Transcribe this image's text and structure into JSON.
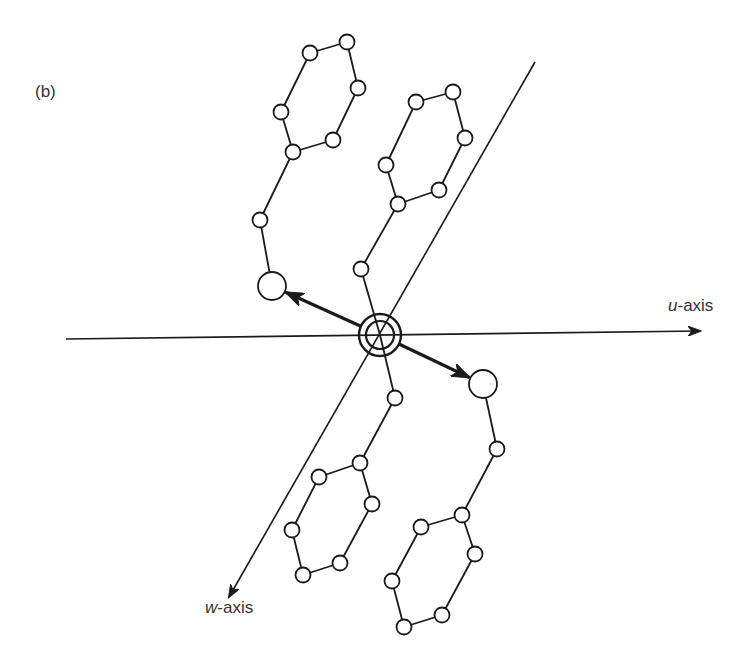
{
  "figure": {
    "panel_label": "(b)",
    "u_axis": {
      "variable": "u",
      "suffix": "-axis",
      "start": [
        66,
        339
      ],
      "end": [
        700,
        331
      ]
    },
    "w_axis": {
      "variable": "w",
      "suffix": "-axis",
      "start": [
        535,
        62
      ],
      "end": [
        229,
        597
      ]
    },
    "colors": {
      "stroke": "#1a1a1a",
      "atom_fill": "#ffffff",
      "background": "#ffffff"
    },
    "center_atom": {
      "x": 380,
      "y": 335,
      "outer_r": 21,
      "inner_r": 14
    },
    "large_atoms": [
      {
        "name": "left",
        "x": 272,
        "y": 286,
        "r": 14
      },
      {
        "name": "right",
        "x": 483,
        "y": 384,
        "r": 14
      }
    ],
    "dipole_arrows": [
      {
        "from": [
          380,
          335
        ],
        "to": [
          272,
          286
        ]
      },
      {
        "from": [
          380,
          335
        ],
        "to": [
          483,
          384
        ]
      }
    ],
    "small_atom_radius": 7.5,
    "rings": [
      {
        "name": "upper-left-ring",
        "atoms": [
          [
            310,
            53
          ],
          [
            347,
            42
          ],
          [
            358,
            88
          ],
          [
            333,
            140
          ],
          [
            293,
            152
          ],
          [
            281,
            112
          ]
        ]
      },
      {
        "name": "upper-middle-ring",
        "atoms": [
          [
            416,
            102
          ],
          [
            453,
            92
          ],
          [
            465,
            138
          ],
          [
            439,
            190
          ],
          [
            398,
            204
          ],
          [
            386,
            165
          ]
        ]
      },
      {
        "name": "lower-left-ring",
        "atoms": [
          [
            360,
            463
          ],
          [
            319,
            477
          ],
          [
            292,
            530
          ],
          [
            303,
            575
          ],
          [
            340,
            563
          ],
          [
            372,
            504
          ]
        ]
      },
      {
        "name": "lower-right-ring",
        "atoms": [
          [
            462,
            515
          ],
          [
            421,
            527
          ],
          [
            392,
            581
          ],
          [
            404,
            627
          ],
          [
            442,
            615
          ],
          [
            475,
            554
          ]
        ]
      }
    ],
    "link_atoms": [
      {
        "name": "link-upper-left",
        "x": 260,
        "y": 220
      },
      {
        "name": "link-upper-middle",
        "x": 361,
        "y": 269
      },
      {
        "name": "link-lower-left",
        "x": 395,
        "y": 398
      },
      {
        "name": "link-lower-right",
        "x": 497,
        "y": 449
      }
    ],
    "bonds": [
      [
        [
          293,
          152
        ],
        [
          260,
          220
        ]
      ],
      [
        [
          260,
          220
        ],
        [
          272,
          286
        ]
      ],
      [
        [
          398,
          204
        ],
        [
          361,
          269
        ]
      ],
      [
        [
          361,
          269
        ],
        [
          380,
          335
        ]
      ],
      [
        [
          380,
          335
        ],
        [
          395,
          398
        ]
      ],
      [
        [
          395,
          398
        ],
        [
          360,
          463
        ]
      ],
      [
        [
          483,
          384
        ],
        [
          497,
          449
        ]
      ],
      [
        [
          497,
          449
        ],
        [
          462,
          515
        ]
      ]
    ]
  }
}
